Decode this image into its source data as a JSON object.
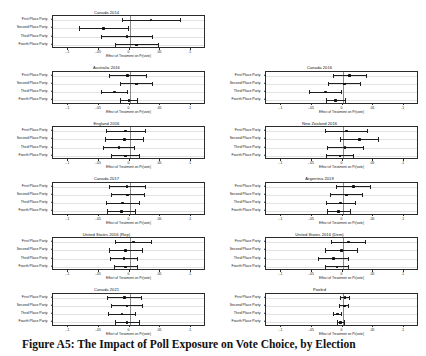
{
  "figure": {
    "caption_label": "Figure A5:",
    "caption_text": "The Impact of Poll Exposure on Vote Choice, by Election"
  },
  "axes": {
    "y_categories": [
      "First Place Party",
      "Second Place Party",
      "Third Place Party",
      "Fourth Place Party"
    ],
    "x_title": "Effect of Treatment on Pr(vote)",
    "x_tick_labels": [
      "-.1",
      "-.05",
      "0",
      ".05",
      ".1"
    ],
    "x_tick_values": [
      -0.1,
      -0.05,
      0,
      0.05,
      0.1
    ],
    "xlim": [
      -0.125,
      0.125
    ],
    "zero_reference": 0
  },
  "chart_data": {
    "type": "scatter",
    "title": "The Impact of Poll Exposure on Vote Choice, by Election",
    "xlabel": "Effect of Treatment on Pr(vote)",
    "ylabel": "",
    "xlim": [
      -0.125,
      0.125
    ],
    "categories": [
      "First Place Party",
      "Second Place Party",
      "Third Place Party",
      "Fourth Place Party"
    ],
    "grid": false,
    "legend": "none",
    "error_bar_type": "95% confidence interval",
    "panels": [
      {
        "title": "Canada 2014",
        "column": "left",
        "row": 1,
        "estimates": [
          0.035,
          -0.042,
          -0.004,
          0.012
        ],
        "ci_low": [
          -0.013,
          -0.083,
          -0.046,
          -0.023
        ],
        "ci_high": [
          0.083,
          -0.001,
          0.038,
          0.047
        ]
      },
      {
        "title": "Canada 2016",
        "column": "right",
        "row": 2,
        "estimates": [
          0.012,
          0.003,
          -0.028,
          -0.011
        ],
        "ci_low": [
          -0.016,
          -0.024,
          -0.055,
          -0.027
        ],
        "ci_high": [
          0.04,
          0.03,
          -0.001,
          0.005
        ]
      },
      {
        "title": "Australia 2016",
        "column": "left",
        "row": 2,
        "estimates": [
          -0.003,
          0.011,
          -0.025,
          -0.001
        ],
        "ci_low": [
          -0.034,
          -0.016,
          -0.047,
          -0.016
        ],
        "ci_high": [
          0.028,
          0.038,
          -0.003,
          0.014
        ]
      },
      {
        "title": "England 2016",
        "column": "left",
        "row": 3,
        "estimates": [
          -0.006,
          -0.008,
          -0.017,
          -0.007
        ],
        "ci_low": [
          -0.038,
          -0.04,
          -0.043,
          -0.03
        ],
        "ci_high": [
          0.026,
          0.024,
          0.009,
          0.016
        ]
      },
      {
        "title": "New Zealand 2016",
        "column": "right",
        "row": 3,
        "estimates": [
          0.006,
          0.028,
          0.004,
          -0.004
        ],
        "ci_low": [
          -0.029,
          -0.004,
          -0.026,
          -0.027
        ],
        "ci_high": [
          0.041,
          0.06,
          0.034,
          0.019
        ]
      },
      {
        "title": "Canada 2017",
        "column": "left",
        "row": 4,
        "estimates": [
          -0.004,
          -0.003,
          -0.011,
          -0.013
        ],
        "ci_low": [
          -0.034,
          -0.031,
          -0.038,
          -0.036
        ],
        "ci_high": [
          0.026,
          0.025,
          0.016,
          0.01
        ]
      },
      {
        "title": "Argentina 2019",
        "column": "right",
        "row": 4,
        "estimates": [
          0.018,
          0.006,
          -0.003,
          -0.006
        ],
        "ci_low": [
          -0.01,
          -0.021,
          -0.027,
          -0.026
        ],
        "ci_high": [
          0.046,
          0.033,
          0.021,
          0.014
        ]
      },
      {
        "title": "United States 2016 (Rep)",
        "column": "left",
        "row": 5,
        "estimates": [
          0.006,
          -0.006,
          -0.009,
          -0.006
        ],
        "ci_low": [
          -0.024,
          -0.034,
          -0.032,
          -0.026
        ],
        "ci_high": [
          0.036,
          0.022,
          0.014,
          0.014
        ]
      },
      {
        "title": "United States 2016 (Dem)",
        "column": "right",
        "row": 5,
        "estimates": [
          0.01,
          -0.002,
          -0.015,
          -0.009
        ],
        "ci_low": [
          -0.018,
          -0.029,
          -0.04,
          -0.029
        ],
        "ci_high": [
          0.038,
          0.025,
          0.01,
          0.011
        ]
      },
      {
        "title": "Canada 2021",
        "column": "left",
        "row": 6,
        "estimates": [
          -0.008,
          -0.004,
          -0.012,
          -0.004
        ],
        "ci_low": [
          -0.036,
          -0.03,
          -0.035,
          -0.024
        ],
        "ci_high": [
          0.02,
          0.022,
          0.011,
          0.016
        ]
      },
      {
        "title": "Pooled",
        "column": "right",
        "row": 6,
        "estimates": [
          0.004,
          0.003,
          -0.008,
          -0.003
        ],
        "ci_low": [
          -0.004,
          -0.005,
          -0.015,
          -0.009
        ],
        "ci_high": [
          0.012,
          0.011,
          -0.001,
          0.003
        ]
      }
    ]
  }
}
